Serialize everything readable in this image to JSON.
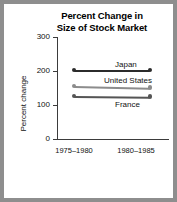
{
  "figure": {
    "background": "#ffffff",
    "page_background": "#8e8e8e"
  },
  "chart_data": {
    "type": "line",
    "title": "Percent Change in Size of Stock Market",
    "title_line1": "Percent Change in",
    "title_line2": "Size of Stock Market",
    "xlabel": "",
    "ylabel": "Percent change",
    "categories": [
      "1975–1980",
      "1980–1985"
    ],
    "x": [
      "1975–1980",
      "1980–1985"
    ],
    "ylim": [
      0,
      300
    ],
    "yticks": [
      0,
      100,
      200,
      300
    ],
    "ytick_labels": [
      "0",
      "100",
      "200",
      "300"
    ],
    "grid": false,
    "legend": "inline-labels",
    "series": [
      {
        "name": "Japan",
        "values": [
          203,
          203
        ],
        "color": "#2b2b2b",
        "label_position": "above-right"
      },
      {
        "name": "United States",
        "values": [
          156,
          151
        ],
        "color": "#8c8c8c",
        "label_position": "above-right"
      },
      {
        "name": "France",
        "values": [
          127,
          125
        ],
        "color": "#555555",
        "label_position": "below-right"
      }
    ]
  }
}
